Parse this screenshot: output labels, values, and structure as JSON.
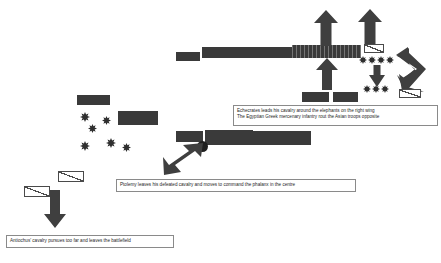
{
  "diagram": {
    "colors": {
      "unit_fill": "#3a3a3a",
      "arrow_fill": "#3f3f3f",
      "cavalry_fill": "#ffffff",
      "cavalry_stroke": "#4a4a4a",
      "elephant_fill": "#2f2f2f",
      "caption_border": "#8a8a8a",
      "caption_text": "#262626",
      "background": "#ffffff"
    }
  },
  "captions": [
    {
      "id": "caption-right-wing",
      "lines": [
        "Echecrates leads his cavalry around the elephants on the right wing",
        "The Egyptian Greek mercenary infantry rout the Asian troops opposite"
      ]
    },
    {
      "id": "caption-centre",
      "lines": [
        "Ptolemy leaves his defeated cavalry and moves to command the phalanx in the centre"
      ]
    },
    {
      "id": "caption-left-wing",
      "lines": [
        "Antiochus' cavalry pursues too far and leaves the battlefield"
      ]
    }
  ],
  "symbols": {
    "infantry_block": "infantry-block",
    "hatched_block": "hatched-infantry-block",
    "cavalry_unit": "cavalry-unit-symbol",
    "elephant_unit": "elephant-unit-symbol",
    "commander_marker": "commander-marker",
    "movement_arrow": "movement-arrow",
    "flanking_arrow": "flanking-elbow-arrow"
  },
  "counts": {
    "left_elephants": 6,
    "right_upper_elephants": 4,
    "right_lower_elephants": 3,
    "cavalry_symbols": 4,
    "arrows": 6
  }
}
